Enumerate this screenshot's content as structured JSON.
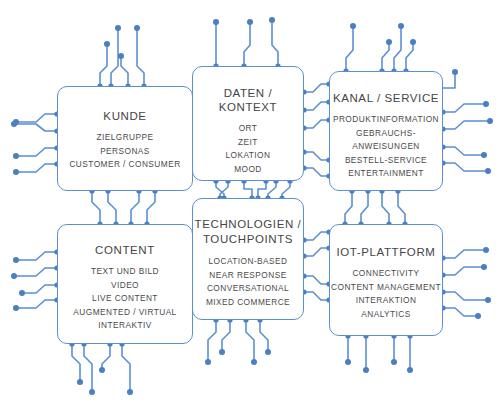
{
  "diagram": {
    "style": {
      "trace_color": "#5b8fd4",
      "node_color": "#4a7fc1",
      "box_border_color": "#5b8fd4",
      "background_color": "#ffffff",
      "text_color": "#454545"
    },
    "boxes": [
      {
        "id": "kunde",
        "title": "KUNDE",
        "items": [
          "ZIELGRUPPE",
          "PERSONAS",
          "CUSTOMER / CONSUMER"
        ]
      },
      {
        "id": "daten",
        "title": "DATEN / KONTEXT",
        "items": [
          "ORT",
          "ZEIT",
          "LOKATION",
          "MOOD"
        ]
      },
      {
        "id": "kanal",
        "title": "KANAL / SERVICE",
        "items": [
          "PRODUKTINFORMATION",
          "GEBRAUCHS-",
          "ANWEISUNGEN",
          "BESTELL-SERVICE",
          "ENTERTAINMENT"
        ]
      },
      {
        "id": "content",
        "title": "CONTENT",
        "items": [
          "TEXT UND BILD",
          "VIDEO",
          "LIVE CONTENT",
          "AUGMENTED / VIRTUAL",
          "INTERAKTIV"
        ]
      },
      {
        "id": "tech",
        "title": "TECHNOLOGIEN /",
        "title2": "TOUCHPOINTS",
        "items": [
          "LOCATION-BASED",
          "NEAR RESPONSE",
          "CONVERSATIONAL",
          "MIXED COMMERCE"
        ]
      },
      {
        "id": "iot",
        "title": "IOT-PLATTFORM",
        "items": [
          "CONNECTIVITY",
          "CONTENT MANAGEMENT",
          "INTERAKTION",
          "ANALYTICS"
        ]
      }
    ]
  }
}
